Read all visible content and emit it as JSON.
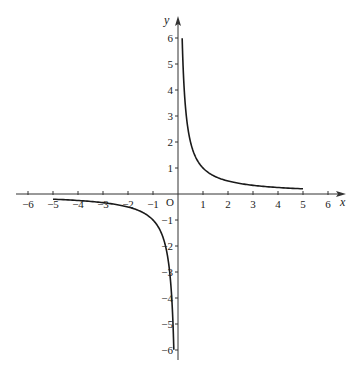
{
  "chart_data": {
    "type": "line",
    "title": "",
    "xlabel": "x",
    "ylabel": "y",
    "origin_label": "O",
    "xlim": [
      -6.5,
      6.5
    ],
    "ylim": [
      -6.5,
      6.5
    ],
    "x_ticks": [
      -6,
      -5,
      -4,
      -3,
      -2,
      -1,
      1,
      2,
      3,
      4,
      5,
      6
    ],
    "y_ticks": [
      -6,
      -5,
      -4,
      -3,
      -2,
      -1,
      1,
      2,
      3,
      4,
      5,
      6
    ],
    "grid": false,
    "function": "y = 1/x",
    "series": [
      {
        "name": "positive branch",
        "x": [
          0.167,
          0.2,
          0.25,
          0.333,
          0.5,
          0.75,
          1,
          1.5,
          2,
          3,
          4,
          5
        ],
        "values": [
          6,
          5,
          4,
          3,
          2,
          1.333,
          1,
          0.667,
          0.5,
          0.333,
          0.25,
          0.2
        ]
      },
      {
        "name": "negative branch",
        "x": [
          -5,
          -4,
          -3,
          -2,
          -1.5,
          -1,
          -0.75,
          -0.5,
          -0.333,
          -0.25,
          -0.2,
          -0.167
        ],
        "values": [
          -0.2,
          -0.25,
          -0.333,
          -0.5,
          -0.667,
          -1,
          -1.333,
          -2,
          -3,
          -4,
          -5,
          -6
        ]
      }
    ]
  }
}
